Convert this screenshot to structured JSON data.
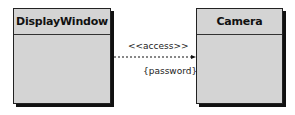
{
  "diagram": {
    "type": "uml-class-dependency",
    "classes": [
      {
        "name": "DisplayWindow"
      },
      {
        "name": "Camera"
      }
    ],
    "relationship": {
      "from": "DisplayWindow",
      "to": "Camera",
      "line_style": "dashed",
      "arrow": "open-arrow",
      "stereotype": "<<access>>",
      "constraint": "{password}"
    }
  }
}
